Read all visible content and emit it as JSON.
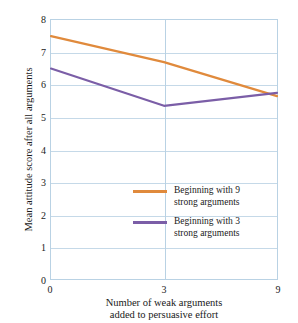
{
  "chart_data": {
    "type": "line",
    "title": "",
    "xlabel": "Number of weak arguments\nadded to persuasive effort",
    "ylabel": "Mean attitude score after all arguments",
    "categories": [
      "0",
      "3",
      "9"
    ],
    "x": [
      0,
      3,
      9
    ],
    "ylim": [
      0,
      8
    ],
    "yticks": [
      "0",
      "1",
      "2",
      "3",
      "4",
      "5",
      "6",
      "7",
      "8"
    ],
    "xticks": [
      "0",
      "3",
      "9"
    ],
    "grid": "horizontal-and-vertical",
    "legend_position": "inside-lower-right",
    "series": [
      {
        "name": "Beginning with 9\nstrong arguments",
        "color": "#e08a3c",
        "values": [
          7.5,
          6.7,
          5.65
        ]
      },
      {
        "name": "Beginning with 3\nstrong arguments",
        "color": "#7b5ea7",
        "values": [
          6.5,
          5.35,
          5.75
        ]
      }
    ]
  },
  "colors": {
    "series_orange": "#e08a3c",
    "series_purple": "#7b5ea7",
    "gridline": "#c5d9e8",
    "axis": "#b9d2e4",
    "background": "#ffffff",
    "text": "#1a1a1a"
  },
  "xlabel_line1": "Number of weak arguments",
  "xlabel_line2": "added to persuasive effort"
}
